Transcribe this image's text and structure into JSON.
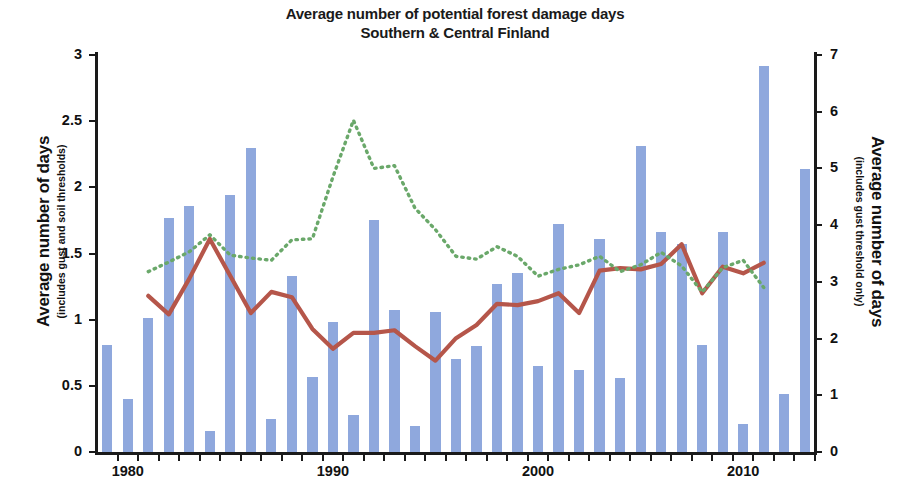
{
  "chart_data": {
    "type": "bar",
    "title": "Average number of potential forest damage days",
    "subtitle": "Southern & Central Finland",
    "xlabel": "",
    "ylabel": "Average number of days",
    "ylabel_sub": "(includes gust and soil thresholds)",
    "y2label": "Average number of days",
    "y2label_sub": "(includes gust threshold only)",
    "ylim": [
      0,
      3
    ],
    "y2lim": [
      0,
      7
    ],
    "yticks": [
      "0",
      "0.5",
      "1",
      "1.5",
      "2",
      "2.5",
      "3"
    ],
    "ytick_values": [
      0,
      0.5,
      1,
      1.5,
      2,
      2.5,
      3
    ],
    "y2ticks": [
      "0",
      "1",
      "2",
      "3",
      "4",
      "5",
      "6",
      "7"
    ],
    "y2tick_values": [
      0,
      1,
      2,
      3,
      4,
      5,
      6,
      7
    ],
    "xtick_labels": [
      "1980",
      "1990",
      "2000",
      "2010"
    ],
    "xtick_values": [
      1980,
      1990,
      2000,
      2010
    ],
    "grid": false,
    "legend": "none",
    "categories": [
      1979,
      1980,
      1981,
      1982,
      1983,
      1984,
      1985,
      1986,
      1987,
      1988,
      1989,
      1990,
      1991,
      1992,
      1993,
      1994,
      1995,
      1996,
      1997,
      1998,
      1999,
      2000,
      2001,
      2002,
      2003,
      2004,
      2005,
      2006,
      2007,
      2008,
      2009,
      2010,
      2011,
      2012,
      2013
    ],
    "series": [
      {
        "name": "Average number of days (includes gust and soil thresholds)",
        "type": "bar",
        "axis": "left",
        "color": "#8fa8dd",
        "values": [
          0.81,
          0.4,
          1.01,
          1.77,
          1.86,
          0.16,
          1.94,
          2.3,
          0.25,
          1.33,
          0.57,
          0.98,
          0.28,
          1.75,
          1.07,
          0.2,
          1.06,
          0.7,
          0.8,
          1.27,
          1.35,
          0.65,
          1.72,
          0.62,
          1.61,
          0.56,
          2.31,
          1.66,
          1.57,
          0.81,
          1.66,
          0.21,
          2.92,
          0.44,
          2.14
        ]
      },
      {
        "name": "11-year running mean (gust and soil thresholds)",
        "type": "line",
        "axis": "left",
        "color": "#b5564a",
        "style": "solid",
        "x": [
          1981,
          1982,
          1983,
          1984,
          1985,
          1986,
          1987,
          1988,
          1989,
          1990,
          1991,
          1992,
          1993,
          1994,
          1995,
          1996,
          1997,
          1998,
          1999,
          2000,
          2001,
          2002,
          2003,
          2004,
          2005,
          2006,
          2007,
          2008,
          2009,
          2010,
          2011
        ],
        "values": [
          1.18,
          1.04,
          1.31,
          1.61,
          1.33,
          1.05,
          1.21,
          1.17,
          0.93,
          0.78,
          0.9,
          0.9,
          0.92,
          0.8,
          0.69,
          0.86,
          0.96,
          1.12,
          1.11,
          1.14,
          1.2,
          1.05,
          1.37,
          1.39,
          1.38,
          1.42,
          1.57,
          1.2,
          1.4,
          1.35,
          1.43
        ]
      },
      {
        "name": "11-year running mean (gust threshold only)",
        "type": "line",
        "axis": "right",
        "color": "#6aa86a",
        "style": "dotted",
        "x": [
          1981,
          1982,
          1983,
          1984,
          1985,
          1986,
          1987,
          1988,
          1989,
          1990,
          1991,
          1992,
          1993,
          1994,
          1995,
          1996,
          1997,
          1998,
          1999,
          2000,
          2001,
          2002,
          2003,
          2004,
          2005,
          2006,
          2007,
          2008,
          2009,
          2010,
          2011
        ],
        "values": [
          3.18,
          3.35,
          3.53,
          3.83,
          3.47,
          3.42,
          3.38,
          3.74,
          3.76,
          4.85,
          5.85,
          5.0,
          5.05,
          4.3,
          3.92,
          3.45,
          3.4,
          3.62,
          3.45,
          3.1,
          3.22,
          3.3,
          3.45,
          3.18,
          3.3,
          3.52,
          3.28,
          2.82,
          3.25,
          3.38,
          2.9
        ]
      }
    ]
  }
}
